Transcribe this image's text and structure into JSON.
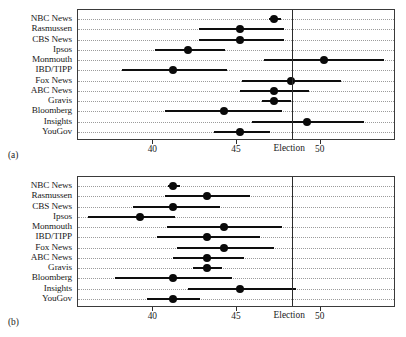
{
  "chart_data": {
    "type": "scatter",
    "title": "",
    "xlabel": "",
    "ylabel": "",
    "xlim": [
      35.5,
      54.5
    ],
    "xticks": [
      40,
      45,
      50
    ],
    "xticklabels": [
      "40",
      "45",
      "50"
    ],
    "grid": true,
    "legend": null,
    "annotations": [
      {
        "label": "Election",
        "type": "vertical-reference-line",
        "value": 48.3
      }
    ],
    "panels": [
      {
        "key": "a",
        "caption": "(a)",
        "election_label": "Election",
        "election_value": 48.3,
        "categories": [
          "NBC News",
          "Rasmussen",
          "CBS News",
          "Ipsos",
          "Monmouth",
          "IBD/TIPP",
          "Fox News",
          "ABC News",
          "Gravis",
          "Bloomberg",
          "Insights",
          "YouGov"
        ],
        "values": [
          47.2,
          45.2,
          45.2,
          42.1,
          50.2,
          41.2,
          48.2,
          47.2,
          47.2,
          44.2,
          49.2,
          45.2
        ],
        "ci_low": [
          46.9,
          42.7,
          42.7,
          40.1,
          46.6,
          38.1,
          45.3,
          45.2,
          46.5,
          40.7,
          45.9,
          43.6
        ],
        "ci_high": [
          47.6,
          47.8,
          47.8,
          44.3,
          53.8,
          44.4,
          51.2,
          49.3,
          48.2,
          47.7,
          52.6,
          47.0
        ]
      },
      {
        "key": "b",
        "caption": "(b)",
        "election_label": "Election",
        "election_value": 48.3,
        "categories": [
          "NBC News",
          "Rasmussen",
          "CBS News",
          "Ipsos",
          "Monmouth",
          "IBD/TIPP",
          "Fox News",
          "ABC News",
          "Gravis",
          "Bloomberg",
          "Insights",
          "YouGov"
        ],
        "values": [
          41.2,
          43.2,
          41.2,
          39.2,
          44.2,
          43.2,
          44.2,
          43.2,
          43.2,
          41.2,
          45.2,
          41.2
        ],
        "ci_low": [
          40.9,
          40.7,
          38.8,
          36.1,
          40.8,
          40.2,
          41.4,
          41.2,
          42.4,
          37.7,
          42.1,
          39.6
        ],
        "ci_high": [
          41.6,
          45.8,
          44.0,
          41.3,
          47.7,
          46.4,
          47.2,
          45.4,
          44.1,
          44.7,
          48.5,
          42.8
        ]
      }
    ]
  },
  "colors": {
    "marker": "#0a0a0a",
    "line": "#0e0e0e",
    "frame": "#3a3a3a",
    "grid": "#9b9b9b",
    "reference": "#2b2b2b",
    "background": "#ffffff"
  }
}
